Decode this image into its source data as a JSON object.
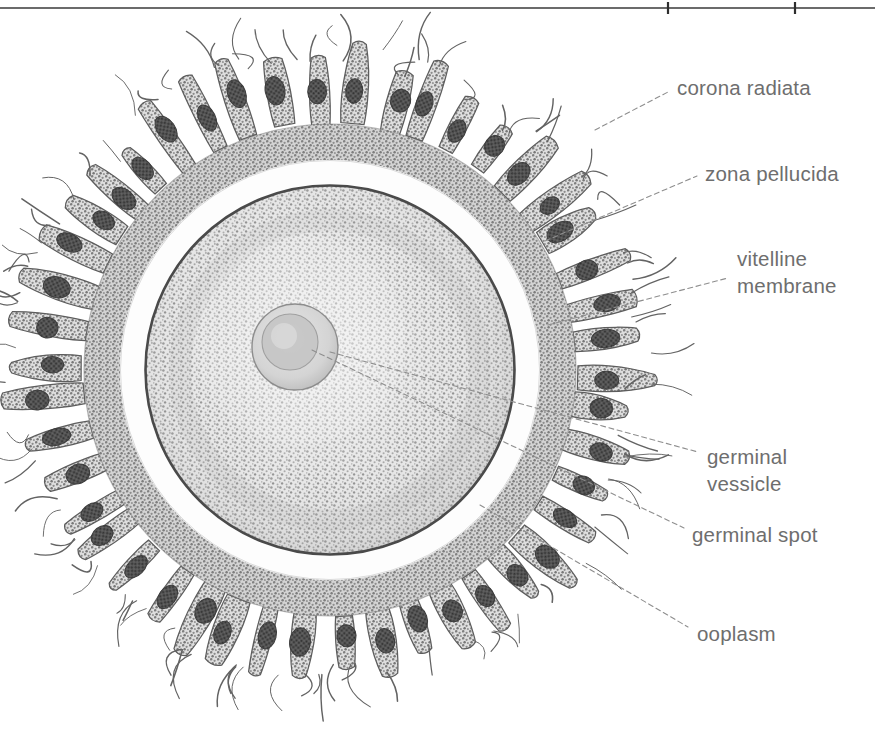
{
  "figure": {
    "style": "scanned grayscale textbook engraving",
    "width": 875,
    "height": 751,
    "background_color": "#ffffff",
    "ink_color": "#6e6e6e",
    "scan_rule_color": "#3a3a3a"
  },
  "labels": [
    {
      "id": "corona-radiata",
      "lines": [
        "corona radiata"
      ],
      "text_x": 677,
      "text_y": 95,
      "leader": "M 595 130 L 668 92"
    },
    {
      "id": "zona-pellucida",
      "lines": [
        "zona pellucida"
      ],
      "text_x": 705,
      "text_y": 181,
      "leader": "M 545 241 L 697 176"
    },
    {
      "id": "vitelline-membrane",
      "lines": [
        "vitelline",
        "membrane"
      ],
      "text_x": 737,
      "text_y": 266,
      "leader": "M 548 325 L 728 278"
    },
    {
      "id": "germinal-vessicle",
      "lines": [
        "germinal",
        "vessicle"
      ],
      "text_x": 707,
      "text_y": 464,
      "leader": "M 330 352 L 698 452"
    },
    {
      "id": "germinal-spot",
      "lines": [
        "germinal spot"
      ],
      "text_x": 692,
      "text_y": 542,
      "leader": "M 312 350 L 684 528"
    },
    {
      "id": "ooplasm",
      "lines": [
        "ooplasm"
      ],
      "text_x": 697,
      "text_y": 641,
      "leader": "M 480 505 L 688 627"
    }
  ],
  "structures": {
    "ovum_center_x": 330,
    "ovum_center_y": 370,
    "ooplasm_radius": 184,
    "vitelline_membrane_radius": 185,
    "zona_pellucida_outer_radius": 210,
    "corona_inner_radius": 210,
    "corona_band_outer_radius": 246,
    "corona_cells_outer_radius": 322,
    "germinal_vessicle": {
      "cx": 295,
      "cy": 347,
      "r": 43
    },
    "germinal_spot": {
      "cx": 290,
      "cy": 342,
      "r": 28
    }
  },
  "colors": {
    "ooplasm_stipple": "#9a9a9a",
    "ooplasm_fill": "#d7d7d7",
    "vitelline_membrane": "#4a4a4a",
    "zona_pellucida": "#fdfdfd",
    "corona_band": "#8d8d8d",
    "corona_cell_body": "#a2a2a2",
    "corona_nucleus": "#4e4e4e",
    "germinal_vessicle_fill": "#d2d2d2",
    "germinal_spot_fill": "#c2c2c2"
  }
}
